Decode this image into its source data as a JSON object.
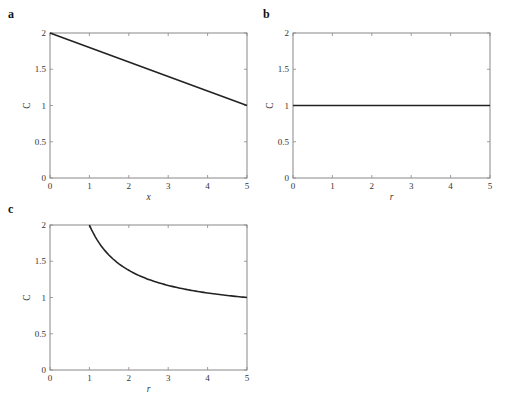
{
  "chart_data": [
    {
      "panel": "a",
      "type": "line",
      "title": "",
      "xlabel": "x",
      "ylabel": "C",
      "xlim": [
        0,
        5
      ],
      "ylim": [
        0,
        2
      ],
      "xticks": [
        "0",
        "1",
        "2",
        "3",
        "4",
        "5"
      ],
      "yticks": [
        "0",
        "0.5",
        "1",
        "1.5",
        "2"
      ],
      "grid": false,
      "series": [
        {
          "name": "C(x)",
          "x": [
            0,
            1,
            2,
            3,
            4,
            5
          ],
          "y": [
            2.0,
            1.8,
            1.6,
            1.4,
            1.2,
            1.0
          ]
        }
      ]
    },
    {
      "panel": "b",
      "type": "line",
      "title": "",
      "xlabel": "r",
      "ylabel": "C",
      "xlim": [
        0,
        5
      ],
      "ylim": [
        0,
        2
      ],
      "xticks": [
        "0",
        "1",
        "2",
        "3",
        "4",
        "5"
      ],
      "yticks": [
        "0",
        "0.5",
        "1",
        "1.5",
        "2"
      ],
      "grid": false,
      "series": [
        {
          "name": "C(r)",
          "x": [
            0,
            1,
            2,
            3,
            4,
            5
          ],
          "y": [
            1.0,
            1.0,
            1.0,
            1.0,
            1.0,
            1.0
          ]
        }
      ]
    },
    {
      "panel": "c",
      "type": "line",
      "title": "",
      "xlabel": "r",
      "ylabel": "C",
      "xlim": [
        0,
        5
      ],
      "ylim": [
        0,
        2
      ],
      "xticks": [
        "0",
        "1",
        "2",
        "3",
        "4",
        "5"
      ],
      "yticks": [
        "0",
        "0.5",
        "1",
        "1.5",
        "2"
      ],
      "grid": false,
      "series": [
        {
          "name": "C(r)",
          "x": [
            1,
            1.5,
            2,
            2.5,
            3,
            3.5,
            4,
            4.5,
            5
          ],
          "y": [
            2.0,
            1.58,
            1.38,
            1.25,
            1.17,
            1.11,
            1.06,
            1.03,
            1.0
          ]
        }
      ]
    }
  ],
  "panels": {
    "a": {
      "label": "a",
      "xlabel": "x",
      "ylabel": "C"
    },
    "b": {
      "label": "b",
      "xlabel": "r",
      "ylabel": "C"
    },
    "c": {
      "label": "c",
      "xlabel": "r",
      "ylabel": "C"
    }
  }
}
